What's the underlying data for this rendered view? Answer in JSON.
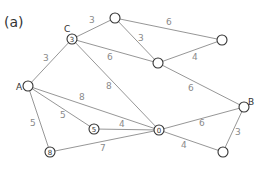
{
  "title": "(a)",
  "nodes": [
    {
      "id": "C",
      "letter": "C",
      "value": "3",
      "x": 72,
      "y": 39
    },
    {
      "id": "T",
      "letter": "",
      "value": "",
      "x": 115,
      "y": 18
    },
    {
      "id": "TR",
      "letter": "",
      "value": "",
      "x": 222,
      "y": 40
    },
    {
      "id": "M",
      "letter": "",
      "value": "",
      "x": 158,
      "y": 63
    },
    {
      "id": "A",
      "letter": "A",
      "value": "",
      "x": 28,
      "y": 86
    },
    {
      "id": "N5",
      "letter": "",
      "value": "5",
      "x": 94,
      "y": 129
    },
    {
      "id": "X",
      "letter": "",
      "value": "0",
      "x": 159,
      "y": 130
    },
    {
      "id": "B",
      "letter": "B",
      "value": "",
      "x": 244,
      "y": 107
    },
    {
      "id": "BR",
      "letter": "",
      "value": "",
      "x": 223,
      "y": 152
    },
    {
      "id": "BL",
      "letter": "",
      "value": "8",
      "x": 50,
      "y": 152
    }
  ],
  "edges": [
    {
      "from": "A",
      "to": "C",
      "weight": "3"
    },
    {
      "from": "C",
      "to": "T",
      "weight": "3"
    },
    {
      "from": "C",
      "to": "M",
      "weight": "6"
    },
    {
      "from": "C",
      "to": "X",
      "weight": "8"
    },
    {
      "from": "T",
      "to": "TR",
      "weight": "6"
    },
    {
      "from": "T",
      "to": "M",
      "weight": "3"
    },
    {
      "from": "M",
      "to": "TR",
      "weight": "4"
    },
    {
      "from": "M",
      "to": "B",
      "weight": "6"
    },
    {
      "from": "A",
      "to": "X",
      "weight": "8"
    },
    {
      "from": "A",
      "to": "N5",
      "weight": "5"
    },
    {
      "from": "A",
      "to": "BL",
      "weight": "5"
    },
    {
      "from": "N5",
      "to": "X",
      "weight": "4"
    },
    {
      "from": "BL",
      "to": "X",
      "weight": "7"
    },
    {
      "from": "X",
      "to": "B",
      "weight": "6"
    },
    {
      "from": "X",
      "to": "BR",
      "weight": "4"
    },
    {
      "from": "B",
      "to": "BR",
      "weight": "3"
    }
  ],
  "labels": {
    "title": "(a)",
    "node_C_letter": "C",
    "node_A_letter": "A",
    "node_B_letter": "B",
    "node_C_value": "3",
    "node_N5_value": "5",
    "node_X_value": "0",
    "node_BL_value": "8",
    "w_A_C": "3",
    "w_C_T": "3",
    "w_C_M": "6",
    "w_C_X": "8",
    "w_T_TR": "6",
    "w_T_M": "3",
    "w_M_TR": "4",
    "w_M_B": "6",
    "w_A_X": "8",
    "w_A_N5": "5",
    "w_A_BL": "5",
    "w_N5_X": "4",
    "w_BL_X": "7",
    "w_X_B": "6",
    "w_X_BR": "4",
    "w_B_BR": "3"
  }
}
